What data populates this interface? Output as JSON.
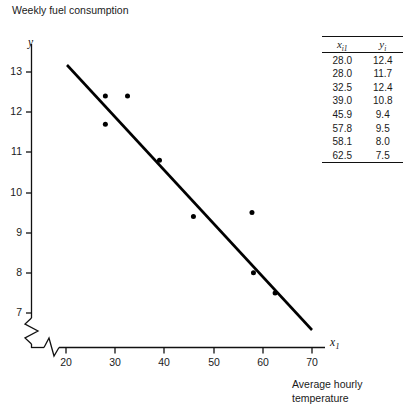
{
  "figure": {
    "y_axis_caption": "Weekly fuel consumption",
    "x_axis_caption": "Average hourly temperature",
    "y_symbol": "y",
    "x_symbol": "x",
    "x_symbol_sub": "1"
  },
  "table": {
    "headers": [
      {
        "base": "x",
        "sub": "i1"
      },
      {
        "base": "y",
        "sub": "i"
      }
    ],
    "rows": [
      {
        "x": "28.0",
        "y": "12.4"
      },
      {
        "x": "28.0",
        "y": "11.7"
      },
      {
        "x": "32.5",
        "y": "12.4"
      },
      {
        "x": "39.0",
        "y": "10.8"
      },
      {
        "x": "45.9",
        "y": "9.4"
      },
      {
        "x": "57.8",
        "y": "9.5"
      },
      {
        "x": "58.1",
        "y": "8.0"
      },
      {
        "x": "62.5",
        "y": "7.5"
      }
    ]
  },
  "chart_data": {
    "type": "scatter",
    "title": "",
    "xlabel": "Average hourly temperature",
    "ylabel": "Weekly fuel consumption",
    "x_symbol": "x1",
    "y_symbol": "y",
    "xlim": [
      20,
      70
    ],
    "ylim": [
      7,
      13
    ],
    "xticks": [
      20,
      30,
      40,
      50,
      60,
      70
    ],
    "yticks": [
      7,
      8,
      9,
      10,
      11,
      12,
      13
    ],
    "grid": false,
    "legend": false,
    "axis_break_x": true,
    "axis_break_y": true,
    "series": [
      {
        "name": "observations",
        "type": "scatter",
        "marker": "filled-circle",
        "color": "#000000",
        "points": [
          {
            "x": 28.0,
            "y": 12.4
          },
          {
            "x": 28.0,
            "y": 11.7
          },
          {
            "x": 32.5,
            "y": 12.4
          },
          {
            "x": 39.0,
            "y": 10.8
          },
          {
            "x": 45.9,
            "y": 9.4
          },
          {
            "x": 57.8,
            "y": 9.5
          },
          {
            "x": 58.1,
            "y": 8.0
          },
          {
            "x": 62.5,
            "y": 7.5
          }
        ]
      },
      {
        "name": "least-squares-line",
        "type": "line",
        "color": "#000000",
        "endpoints": [
          {
            "x": 20.2,
            "y": 13.18
          },
          {
            "x": 70.0,
            "y": 6.55
          }
        ]
      }
    ]
  },
  "geometry": {
    "x_axis_y": 348,
    "y_axis_x": 31,
    "x20_px": 66,
    "x70_px": 312,
    "y13_px": 72,
    "y7_px": 313
  }
}
